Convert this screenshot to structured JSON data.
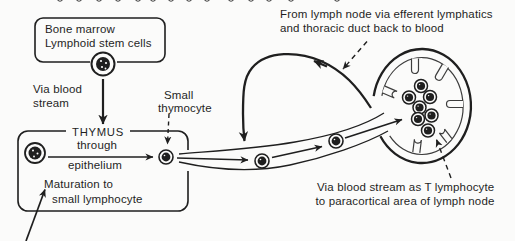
{
  "figure": {
    "colors": {
      "ink": "#1f1f1f",
      "background": "#fbfbfa",
      "node_inner_line": "#3d3d3d"
    },
    "bone_marrow_box": {
      "line1": "Bone marrow",
      "line2": "Lymphoid stem cells"
    },
    "via_blood_label": {
      "line1": "Via blood",
      "line2": "stream"
    },
    "thymus_box": {
      "title": "THYMUS",
      "through": "through",
      "epithelium": "epithelium",
      "maturation1": "Maturation to",
      "maturation2": "small lymphocyte"
    },
    "small_thymocyte_label": {
      "line1": "Small",
      "line2": "thymocyte"
    },
    "efferent_label": {
      "line1": "From lymph node via efferent lymphatics",
      "line2": "and thoracic duct back to blood"
    },
    "paracortical_label": {
      "line1": "Via blood stream as T lymphocyte",
      "line2": "to paracortical area of lymph node"
    }
  }
}
